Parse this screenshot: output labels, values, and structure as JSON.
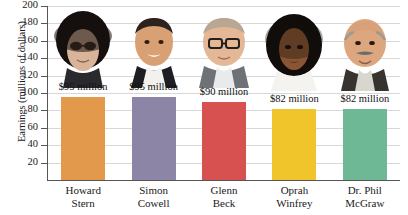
{
  "chart_data": {
    "type": "bar",
    "title": "",
    "xlabel": "",
    "ylabel": "Earnings (millions of dollars)",
    "ylim": [
      0,
      200
    ],
    "ytick_step": 20,
    "grid": true,
    "legend": "none",
    "categories": [
      "Howard Stern",
      "Simon Cowell",
      "Glenn Beck",
      "Oprah Winfrey",
      "Dr. Phil McGraw"
    ],
    "category_lines": [
      [
        "Howard",
        "Stern"
      ],
      [
        "Simon",
        "Cowell"
      ],
      [
        "Glenn",
        "Beck"
      ],
      [
        "Oprah",
        "Winfrey"
      ],
      [
        "Dr. Phil",
        "McGraw"
      ]
    ],
    "values": [
      95,
      95,
      90,
      82,
      82
    ],
    "data_labels": [
      "$95 million",
      "$95 million",
      "$90 million",
      "$82 million",
      "$82 million"
    ],
    "bar_colors": [
      "#E2994B",
      "#8D85A6",
      "#D6514F",
      "#EFC52B",
      "#6FB895"
    ],
    "ytick_labels": [
      "20",
      "40",
      "60",
      "80",
      "100",
      "120",
      "140",
      "160",
      "180",
      "200"
    ],
    "ytick_values": [
      20,
      40,
      60,
      80,
      100,
      120,
      140,
      160,
      180,
      200
    ],
    "photo_alt": [
      "howard-stern-photo",
      "simon-cowell-photo",
      "glenn-beck-photo",
      "oprah-winfrey-photo",
      "dr-phil-mcgraw-photo"
    ],
    "axis_color": "#555555",
    "gridline_color": "#d8d8d8",
    "background_color": "#ffffff"
  }
}
